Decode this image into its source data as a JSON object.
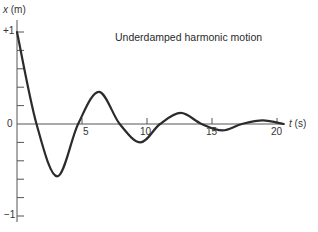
{
  "chart_data": {
    "type": "line",
    "title": "Underdamped harmonic motion",
    "xlabel": "t (s)",
    "ylabel": "x (m)",
    "xlabel_var": "t",
    "xlabel_unit": "(s)",
    "ylabel_var": "x",
    "ylabel_unit": "(m)",
    "xlim": [
      0,
      21
    ],
    "ylim": [
      -1,
      1
    ],
    "x_ticks": [
      5,
      10,
      15,
      20
    ],
    "x_tick_labels": [
      "5",
      "10",
      "15",
      "20"
    ],
    "y_ticks": [
      -1,
      -0.8,
      -0.6,
      -0.4,
      -0.2,
      0,
      0.2,
      0.4,
      0.6,
      0.8,
      1
    ],
    "y_tick_labels": {
      "top": "+1",
      "zero": "0",
      "bottom": "−1"
    },
    "grid": false,
    "legend": "none",
    "series": [
      {
        "name": "x(t)",
        "model": "x = e^(-0.17 t) cos(1.0 t)",
        "x": [
          0,
          1.5,
          3.1,
          4.7,
          6.3,
          7.9,
          9.5,
          11.0,
          12.6,
          14.2,
          15.8,
          17.3,
          18.9,
          20.5
        ],
        "y": [
          1.0,
          0.0,
          -0.57,
          0.0,
          0.35,
          0.0,
          -0.2,
          0.0,
          0.12,
          0.0,
          -0.07,
          0.0,
          0.04,
          0.0
        ]
      }
    ]
  },
  "labels": {
    "title": "Underdamped harmonic motion",
    "y_axis_var": "x",
    "y_axis_unit": "(m)",
    "x_axis_var": "t",
    "x_axis_unit": "(s)",
    "y_top": "+1",
    "y_zero": "0",
    "y_bottom": "−1",
    "x5": "5",
    "x10": "10",
    "x15": "15",
    "x20": "20"
  },
  "colors": {
    "curve": "#2b2b2b",
    "axes": "#555555",
    "text": "#333333"
  }
}
